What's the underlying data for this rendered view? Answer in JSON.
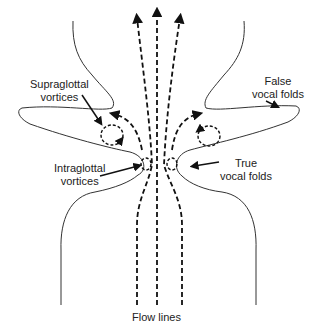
{
  "figure": {
    "type": "diagram",
    "labels": {
      "supraglottal": [
        "Supraglottal",
        "vortices"
      ],
      "intraglottal": [
        "Intraglottal",
        "vortices"
      ],
      "false_folds": [
        "False",
        "vocal folds"
      ],
      "true_folds": [
        "True",
        "vocal folds"
      ],
      "flow_lines": "Flow lines"
    },
    "colors": {
      "line": "#333333",
      "flow": "#111111",
      "background": "#ffffff"
    }
  }
}
